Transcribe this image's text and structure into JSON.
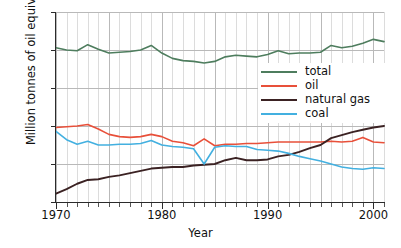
{
  "chart_data": {
    "type": "line",
    "title": "",
    "xlabel": "Year",
    "ylabel": "Million tonnes of oil equivalent",
    "xlim": [
      1970,
      2001
    ],
    "ylim": [
      0,
      250
    ],
    "yticks": [
      0,
      50,
      100,
      150,
      200,
      250
    ],
    "xticks": [
      1970,
      1980,
      1990,
      2000
    ],
    "xtick_labels": [
      "1970",
      "1980",
      "1990",
      "2000"
    ],
    "ytick_labels": [
      "0",
      "50",
      "100",
      "150",
      "200",
      "250"
    ],
    "grid": true,
    "grid_minor_x": true,
    "legend_position": "center-right",
    "x": [
      1970,
      1971,
      1972,
      1973,
      1974,
      1975,
      1976,
      1977,
      1978,
      1979,
      1980,
      1981,
      1982,
      1983,
      1984,
      1985,
      1986,
      1987,
      1988,
      1989,
      1990,
      1991,
      1992,
      1993,
      1994,
      1995,
      1996,
      1997,
      1998,
      1999,
      2000,
      2001
    ],
    "series": [
      {
        "name": "total",
        "color": "#4e7d5e",
        "values": [
          203,
          200,
          199,
          207,
          201,
          196,
          197,
          198,
          200,
          206,
          196,
          189,
          186,
          185,
          183,
          185,
          191,
          193,
          192,
          191,
          194,
          199,
          195,
          196,
          196,
          197,
          206,
          203,
          205,
          209,
          214,
          211
        ]
      },
      {
        "name": "oil",
        "color": "#e8503a",
        "values": [
          98,
          99,
          100,
          102,
          96,
          89,
          86,
          85,
          86,
          89,
          86,
          80,
          78,
          74,
          83,
          74,
          76,
          76,
          77,
          77,
          78,
          79,
          79,
          79,
          79,
          79,
          80,
          79,
          80,
          85,
          79,
          78
        ]
      },
      {
        "name": "natural gas",
        "color": "#3b2223",
        "values": [
          11,
          17,
          24,
          29,
          30,
          33,
          35,
          38,
          41,
          44,
          45,
          46,
          46,
          48,
          49,
          50,
          55,
          58,
          55,
          55,
          56,
          60,
          62,
          66,
          71,
          75,
          84,
          88,
          92,
          95,
          98,
          100
        ]
      },
      {
        "name": "coal",
        "color": "#43b0e0",
        "values": [
          93,
          82,
          76,
          80,
          75,
          75,
          76,
          76,
          77,
          81,
          75,
          73,
          72,
          70,
          50,
          72,
          74,
          73,
          73,
          69,
          68,
          67,
          64,
          60,
          57,
          54,
          50,
          46,
          44,
          43,
          45,
          44
        ]
      }
    ]
  },
  "legend": {
    "items": [
      {
        "label": "total",
        "color": "#4e7d5e"
      },
      {
        "label": "oil",
        "color": "#e8503a"
      },
      {
        "label": "natural gas",
        "color": "#3b2223"
      },
      {
        "label": "coal",
        "color": "#43b0e0"
      }
    ]
  }
}
